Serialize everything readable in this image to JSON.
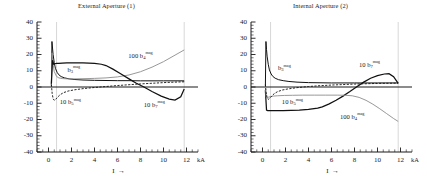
{
  "figure": {
    "panels": [
      {
        "id": "external-aperture",
        "title": "External Aperture (1)",
        "xlabel": "I",
        "xarrow": "→",
        "xunit": "kA"
      },
      {
        "id": "internal-aperture",
        "title": "Internal Aperture (2)",
        "xlabel": "I",
        "xarrow": "→",
        "xunit": "kA"
      }
    ],
    "yticks": [
      "40",
      "30",
      "20",
      "10",
      "0",
      "-10",
      "-20",
      "-30",
      "-40"
    ],
    "xticks": [
      "0",
      "2",
      "4",
      "6",
      "8",
      "10",
      "12"
    ],
    "colors": {
      "axis": "#1a1a1a",
      "curve_dark": "#111111",
      "curve_gray": "#8c8c8c",
      "gridline": "#b0b0b0",
      "background": "#ffffff"
    }
  },
  "chart_data": [
    {
      "type": "line",
      "title": "External Aperture (1)",
      "xlabel": "I",
      "ylabel": "",
      "xunit": "kA",
      "xlim": [
        -1,
        13
      ],
      "ylim": [
        -40,
        40
      ],
      "xticks": [
        0,
        2,
        4,
        6,
        8,
        10,
        12
      ],
      "yticks": [
        -40,
        -30,
        -20,
        -10,
        0,
        10,
        20,
        30,
        40
      ],
      "grid": false,
      "vertical_markers": [
        0.7,
        11.8
      ],
      "legend": "inline-annotations",
      "annotations": [
        {
          "text": "100 b4 mag",
          "x": 8.0,
          "y": 19.0
        },
        {
          "text": "b3 mag",
          "x": 2.2,
          "y": 10.5
        },
        {
          "text": "10 b5 mag",
          "x": 1.9,
          "y": -9.5
        },
        {
          "text": "10 b7 mag",
          "x": 9.2,
          "y": -11.0
        }
      ],
      "series": [
        {
          "name": "b3 mag",
          "style": "solid-dark",
          "x": [
            0.25,
            0.3,
            0.35,
            0.4,
            0.5,
            0.6,
            0.75,
            0.9,
            1.1,
            1.4,
            1.8,
            2.3,
            3.0,
            4.0,
            5.0,
            6.0,
            7.0,
            8.0,
            9.0,
            10.0,
            11.0,
            11.8
          ],
          "values": [
            0.5,
            28.0,
            24.0,
            20.0,
            15.0,
            11.5,
            9.0,
            7.5,
            6.4,
            5.6,
            5.0,
            4.6,
            4.3,
            4.1,
            4.0,
            3.9,
            3.9,
            3.8,
            3.8,
            3.8,
            3.8,
            3.8
          ]
        },
        {
          "name": "100 b4 mag",
          "style": "solid-gray",
          "x": [
            0.25,
            0.3,
            0.4,
            0.5,
            0.7,
            0.9,
            1.2,
            1.6,
            2.2,
            3.0,
            4.0,
            5.0,
            6.0,
            7.0,
            8.0,
            9.0,
            10.0,
            11.0,
            11.8
          ],
          "values": [
            1.0,
            21.0,
            14.0,
            9.5,
            6.5,
            5.6,
            5.2,
            5.0,
            5.0,
            5.1,
            5.3,
            5.6,
            6.2,
            7.4,
            9.4,
            12.2,
            15.6,
            19.6,
            22.8
          ]
        },
        {
          "name": "10 b7 mag",
          "style": "solid-dark-thick",
          "x": [
            0.25,
            0.35,
            0.45,
            0.55,
            0.7,
            0.9,
            1.2,
            1.6,
            2.2,
            3.0,
            4.0,
            4.6,
            5.0,
            5.6,
            6.2,
            7.0,
            7.6,
            8.3,
            9.0,
            9.8,
            10.5,
            11.0,
            11.5,
            11.8
          ],
          "values": [
            2.0,
            16.5,
            14.0,
            14.3,
            14.5,
            14.6,
            14.7,
            14.8,
            14.8,
            14.8,
            14.6,
            14.0,
            13.2,
            11.0,
            8.5,
            5.0,
            2.5,
            0.0,
            -2.8,
            -5.6,
            -7.4,
            -8.1,
            -6.0,
            -1.3
          ]
        },
        {
          "name": "10 b5 mag",
          "style": "dashed-dark",
          "x": [
            0.25,
            0.32,
            0.4,
            0.5,
            0.62,
            0.8,
            1.0,
            1.3,
            1.7,
            2.2,
            3.0,
            4.0,
            5.0,
            6.0,
            7.0,
            8.0,
            9.0,
            10.0,
            11.0,
            11.8
          ],
          "values": [
            1.5,
            -4.0,
            -7.2,
            -8.2,
            -7.6,
            -6.2,
            -4.8,
            -3.5,
            -2.5,
            -1.8,
            -1.0,
            -0.3,
            0.3,
            0.9,
            1.4,
            1.9,
            2.3,
            2.7,
            3.0,
            3.2
          ]
        }
      ]
    },
    {
      "type": "line",
      "title": "Internal Aperture (2)",
      "xlabel": "I",
      "ylabel": "",
      "xunit": "kA",
      "xlim": [
        -1,
        13
      ],
      "ylim": [
        -40,
        40
      ],
      "xticks": [
        0,
        2,
        4,
        6,
        8,
        10,
        12
      ],
      "yticks": [
        -40,
        -30,
        -20,
        -10,
        0,
        10,
        20,
        30,
        40
      ],
      "grid": false,
      "vertical_markers": [
        0.7,
        11.8
      ],
      "legend": "inline-annotations",
      "annotations": [
        {
          "text": "b3 mag",
          "x": 1.9,
          "y": 11.5
        },
        {
          "text": "10 b7 mag",
          "x": 9.3,
          "y": 13.5
        },
        {
          "text": "10 b5 mag",
          "x": 2.6,
          "y": -9.5
        },
        {
          "text": "100 b4 mag",
          "x": 7.8,
          "y": -18.5
        }
      ],
      "series": [
        {
          "name": "b3 mag",
          "style": "solid-dark",
          "x": [
            0.25,
            0.3,
            0.35,
            0.4,
            0.5,
            0.6,
            0.75,
            0.9,
            1.1,
            1.4,
            1.8,
            2.3,
            3.0,
            4.0,
            5.0,
            6.0,
            7.0,
            8.0,
            9.0,
            10.0,
            11.0,
            11.8
          ],
          "values": [
            0.5,
            28.0,
            23.0,
            19.0,
            14.0,
            10.5,
            8.0,
            6.5,
            5.4,
            4.5,
            3.9,
            3.4,
            3.0,
            2.7,
            2.6,
            2.5,
            2.5,
            2.5,
            2.5,
            2.5,
            2.5,
            2.5
          ]
        },
        {
          "name": "10 b7 mag",
          "style": "solid-dark-thick",
          "x": [
            0.25,
            0.35,
            0.45,
            0.55,
            0.7,
            0.9,
            1.2,
            1.8,
            2.5,
            3.2,
            4.0,
            4.8,
            5.2,
            5.8,
            6.4,
            7.0,
            7.6,
            8.2,
            8.8,
            9.4,
            10.0,
            10.6,
            11.0,
            11.4,
            11.8
          ],
          "values": [
            -2.0,
            -14.2,
            -14.5,
            -14.5,
            -14.5,
            -14.5,
            -14.5,
            -14.5,
            -14.4,
            -14.2,
            -13.8,
            -13.0,
            -12.2,
            -10.4,
            -8.2,
            -5.6,
            -2.8,
            0.2,
            3.0,
            5.4,
            7.0,
            8.0,
            8.2,
            6.4,
            2.2
          ]
        },
        {
          "name": "100 b4 mag",
          "style": "solid-gray",
          "x": [
            0.25,
            0.32,
            0.42,
            0.55,
            0.7,
            0.95,
            1.3,
            1.9,
            2.6,
            3.5,
            4.5,
            5.5,
            6.5,
            7.2,
            7.8,
            8.4,
            9.0,
            9.6,
            10.2,
            10.8,
            11.4,
            11.8
          ],
          "values": [
            0.5,
            -6.0,
            -6.4,
            -6.2,
            -5.9,
            -5.6,
            -5.4,
            -5.2,
            -5.1,
            -5.0,
            -5.0,
            -5.0,
            -5.0,
            -5.1,
            -5.4,
            -6.4,
            -8.2,
            -10.6,
            -13.4,
            -16.4,
            -19.4,
            -21.2
          ]
        },
        {
          "name": "10 b5 mag",
          "style": "dashed-dark",
          "x": [
            0.25,
            0.32,
            0.4,
            0.5,
            0.62,
            0.8,
            1.0,
            1.3,
            1.7,
            2.2,
            3.0,
            4.0,
            5.0,
            6.0,
            7.0,
            8.0,
            9.0,
            10.0,
            11.0,
            11.8
          ],
          "values": [
            1.5,
            -3.5,
            -6.6,
            -7.6,
            -7.0,
            -5.6,
            -4.2,
            -2.9,
            -1.9,
            -1.2,
            -0.4,
            0.3,
            0.8,
            1.2,
            1.5,
            1.8,
            2.0,
            2.2,
            2.3,
            2.4
          ]
        }
      ]
    }
  ]
}
